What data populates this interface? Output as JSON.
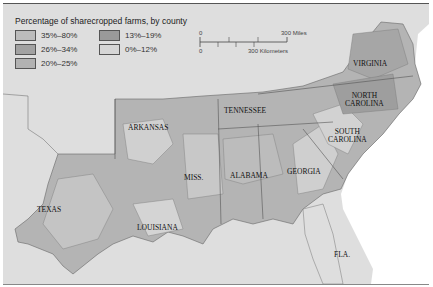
{
  "legend": {
    "title": "Percentage of sharecropped farms, by county",
    "items": [
      {
        "label": "35%–80%",
        "color": "#bcbcbc"
      },
      {
        "label": "13%–19%",
        "color": "#9a9a9a"
      },
      {
        "label": "26%–34%",
        "color": "#a2a2a2"
      },
      {
        "label": "0%–12%",
        "color": "#d6d6d6"
      },
      {
        "label": "20%–25%",
        "color": "#b2b2b2"
      }
    ]
  },
  "scale_bar": {
    "miles_zero": "0",
    "miles_label": "300 Miles",
    "km_zero": "0",
    "km_label": "300 Kilometers"
  },
  "states": {
    "virginia": "VIRGINIA",
    "north_carolina_1": "NORTH",
    "north_carolina_2": "CAROLINA",
    "tennessee": "TENNESSEE",
    "arkansas": "ARKANSAS",
    "south_carolina_1": "SOUTH",
    "south_carolina_2": "CAROLINA",
    "mississippi": "MISS.",
    "alabama": "ALABAMA",
    "georgia": "GEORGIA",
    "texas": "TEXAS",
    "louisiana": "LOUISIANA",
    "florida": "FLA."
  },
  "colors": {
    "outside_land": "#dedede",
    "sea": "#ffffff"
  }
}
